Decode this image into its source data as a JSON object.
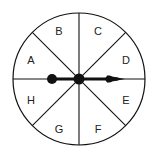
{
  "spinner": {
    "sections": [
      {
        "label": "A"
      },
      {
        "label": "B"
      },
      {
        "label": "C"
      },
      {
        "label": "D"
      },
      {
        "label": "E"
      },
      {
        "label": "F"
      },
      {
        "label": "G"
      },
      {
        "label": "H"
      }
    ],
    "pointer_direction": "right",
    "pointer_between": [
      "D",
      "E"
    ],
    "colors": {
      "stroke": "#111111",
      "fill": "#ffffff"
    }
  }
}
